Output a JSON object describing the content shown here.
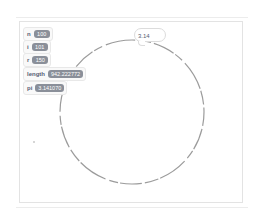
{
  "stage": {
    "monitors": [
      {
        "name": "n",
        "value": "100"
      },
      {
        "name": "i",
        "value": "101"
      },
      {
        "name": "r",
        "value": "150"
      },
      {
        "name": "length",
        "value": "942.222772"
      },
      {
        "name": "pi",
        "value": "3.141070"
      }
    ],
    "speech_bubble": {
      "text": "3.14"
    },
    "drawing": {
      "shape": "circle",
      "stroke_color": "#8a8a8a"
    }
  }
}
